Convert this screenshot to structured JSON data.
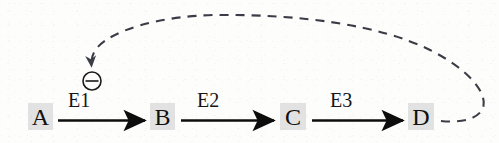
{
  "diagram": {
    "type": "pathway-diagram",
    "background_color": "#fdfdfc",
    "node_fill_color": "#e2e2e2",
    "node_text_color": "#101010",
    "arrow_color": "#0d0d0d",
    "dashed_edge_color": "#3c3c46",
    "nodes": [
      {
        "id": "A",
        "label": "A",
        "x": 28,
        "y": 103,
        "w": 25,
        "h": 27
      },
      {
        "id": "B",
        "label": "B",
        "x": 150,
        "y": 103,
        "w": 25,
        "h": 27
      },
      {
        "id": "C",
        "label": "C",
        "x": 280,
        "y": 103,
        "w": 26,
        "h": 27
      },
      {
        "id": "D",
        "label": "D",
        "x": 408,
        "y": 103,
        "w": 26,
        "h": 27
      }
    ],
    "edges": [
      {
        "id": "E1",
        "label": "E1",
        "from": "A",
        "to": "B",
        "style": "solid",
        "label_x": 68,
        "label_y": 90
      },
      {
        "id": "E2",
        "label": "E2",
        "from": "B",
        "to": "C",
        "style": "solid",
        "label_x": 197,
        "label_y": 90
      },
      {
        "id": "E3",
        "label": "E3",
        "from": "C",
        "to": "D",
        "style": "solid",
        "label_x": 330,
        "label_y": 90
      }
    ],
    "feedback": {
      "id": "feedback-inhibition",
      "from": "D",
      "to": "E1",
      "style": "dashed",
      "symbol": "minus-circle-icon",
      "symbol_glyph": "⊖",
      "symbol_x": 92,
      "symbol_y": 81,
      "symbol_radius": 9
    }
  }
}
